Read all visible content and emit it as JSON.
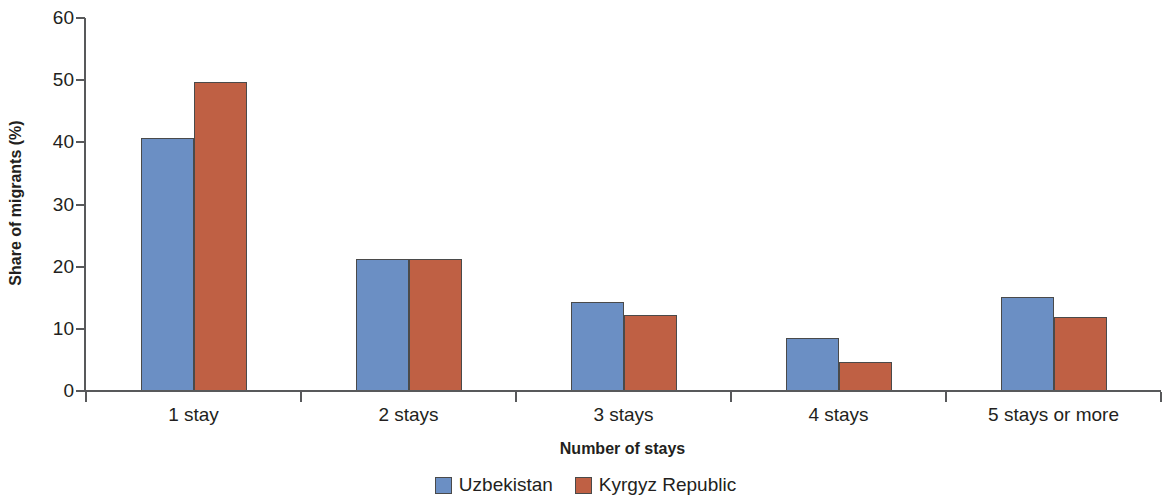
{
  "chart_data": {
    "type": "bar",
    "title": "",
    "xlabel": "Number of stays",
    "ylabel": "Share of migrants (%)",
    "categories": [
      "1 stay",
      "2 stays",
      "3 stays",
      "4 stays",
      "5 stays or more"
    ],
    "series": [
      {
        "name": "Uzbekistan",
        "color": "#6b8fc4",
        "values": [
          40.7,
          21.3,
          14.3,
          8.5,
          15.1
        ]
      },
      {
        "name": "Kyrgyz Republic",
        "color": "#bf6044",
        "values": [
          49.7,
          21.2,
          12.3,
          4.6,
          11.9
        ]
      }
    ],
    "ylim": [
      0,
      60
    ],
    "yticks": [
      0,
      10,
      20,
      30,
      40,
      50,
      60
    ],
    "ytick_labels": [
      "0",
      "10",
      "20",
      "30",
      "40",
      "50",
      "60"
    ],
    "grid": false,
    "legend_position": "bottom-center",
    "axis_color": "#58595b",
    "bar_edge_color": "#4a4a4a",
    "text_color": "#231f20"
  },
  "legend": {
    "items": [
      {
        "label": "Uzbekistan",
        "swatch": "legend-swatch-uzbekistan"
      },
      {
        "label": "Kyrgyz Republic",
        "swatch": "legend-swatch-kyrgyz-republic"
      }
    ]
  }
}
